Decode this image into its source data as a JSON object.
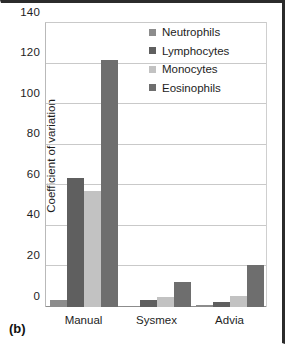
{
  "caption": "(b)",
  "chart_data": {
    "type": "bar",
    "title": "",
    "subtitle": "",
    "xlabel": "",
    "ylabel": "Coefficient of variation",
    "ylim": [
      0,
      140
    ],
    "ytick_step": 20,
    "yticks": [
      "140",
      "120",
      "100",
      "80",
      "60",
      "40",
      "20",
      "0"
    ],
    "grid": true,
    "legend_position": "top-right",
    "categories": [
      "Manual",
      "Sysmex",
      "Advia"
    ],
    "series": [
      {
        "name": "Neutrophils",
        "color": "#8c8c8c",
        "values": [
          3.5,
          0.5,
          1.0
        ]
      },
      {
        "name": "Lymphocytes",
        "color": "#5f5f5f",
        "values": [
          63.5,
          3.5,
          2.5
        ]
      },
      {
        "name": "Monocytes",
        "color": "#c2c2c2",
        "values": [
          57.0,
          5.0,
          5.5
        ]
      },
      {
        "name": "Eosinophils",
        "color": "#6e6e6e",
        "values": [
          122.0,
          12.5,
          20.5
        ]
      }
    ]
  }
}
